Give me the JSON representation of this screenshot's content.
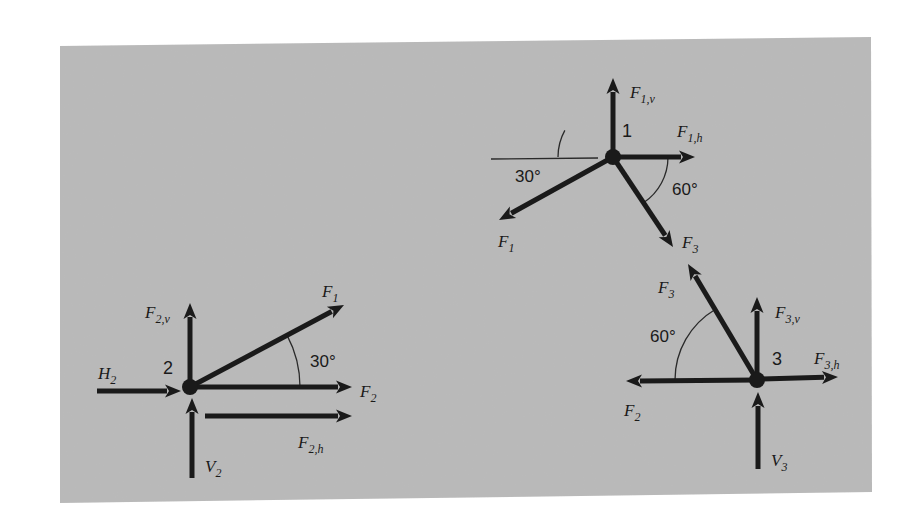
{
  "colors": {
    "page_background": "#ffffff",
    "panel_fill": "#b9b9b9",
    "ink": "#1a1a1a",
    "thin_line": "#2a2a2a"
  },
  "panel": {
    "points": "60,46 871,37 872,492 60,503"
  },
  "nodes": [
    {
      "id": "1",
      "label": "1",
      "center": [
        613,
        157
      ],
      "label_pos": [
        622,
        137
      ],
      "forces": [
        {
          "name": "F1v",
          "label_main": "F",
          "label_sub": "1,v",
          "from": [
            613,
            157
          ],
          "to": [
            613,
            78
          ],
          "label_pos": [
            630,
            98
          ]
        },
        {
          "name": "F1h",
          "label_main": "F",
          "label_sub": "1,h",
          "from": [
            613,
            157
          ],
          "to": [
            695,
            157
          ],
          "label_pos": [
            677,
            137
          ]
        },
        {
          "name": "F1",
          "label_main": "F",
          "label_sub": "1",
          "from": [
            613,
            157
          ],
          "to": [
            499,
            220
          ],
          "label_pos": [
            498,
            247
          ]
        },
        {
          "name": "F3",
          "label_main": "F",
          "label_sub": "3",
          "from": [
            613,
            157
          ],
          "to": [
            673,
            247
          ],
          "label_pos": [
            682,
            248
          ]
        }
      ],
      "reference_lines": [
        {
          "from": [
            491,
            159
          ],
          "to": [
            598,
            158
          ]
        }
      ],
      "angles": [
        {
          "label": "30°",
          "arc_center": [
            613,
            157
          ],
          "radius": 55,
          "start_deg": 180,
          "end_deg": 208.9,
          "label_pos": [
            515,
            182
          ]
        },
        {
          "label": "60°",
          "arc_center": [
            613,
            157
          ],
          "radius": 55,
          "start_deg": 0,
          "end_deg": 56.3,
          "label_pos": [
            672,
            195
          ]
        }
      ]
    },
    {
      "id": "2",
      "label": "2",
      "center": [
        190,
        387
      ],
      "label_pos": [
        163,
        374
      ],
      "forces": [
        {
          "name": "F2v",
          "label_main": "F",
          "label_sub": "2,v",
          "from": [
            190,
            387
          ],
          "to": [
            190,
            303
          ],
          "label_pos": [
            145,
            318
          ]
        },
        {
          "name": "H2",
          "label_main": "H",
          "label_sub": "2",
          "from": [
            97,
            391
          ],
          "to": [
            181,
            391
          ],
          "label_pos": [
            98,
            379
          ]
        },
        {
          "name": "F1",
          "label_main": "F",
          "label_sub": "1",
          "from": [
            190,
            387
          ],
          "to": [
            344,
            305
          ],
          "label_pos": [
            322,
            297
          ]
        },
        {
          "name": "F2",
          "label_main": "F",
          "label_sub": "2",
          "from": [
            190,
            387
          ],
          "to": [
            352,
            387
          ],
          "label_pos": [
            360,
            397
          ]
        },
        {
          "name": "F2h",
          "label_main": "F",
          "label_sub": "2,h",
          "from": [
            205,
            416
          ],
          "to": [
            352,
            416
          ],
          "label_pos": [
            298,
            448
          ]
        },
        {
          "name": "V2",
          "label_main": "V",
          "label_sub": "2",
          "from": [
            192,
            478
          ],
          "to": [
            192,
            398
          ],
          "label_pos": [
            205,
            472
          ]
        }
      ],
      "reference_lines": [],
      "angles": [
        {
          "label": "30°",
          "arc_center": [
            190,
            387
          ],
          "radius": 110,
          "start_deg": 0,
          "end_deg": -28,
          "label_pos": [
            310,
            367
          ]
        }
      ]
    },
    {
      "id": "3",
      "label": "3",
      "center": [
        757,
        380
      ],
      "label_pos": [
        772,
        365
      ],
      "forces": [
        {
          "name": "F3",
          "label_main": "F",
          "label_sub": "3",
          "from": [
            757,
            380
          ],
          "to": [
            688,
            264
          ],
          "label_pos": [
            658,
            293
          ]
        },
        {
          "name": "F3v",
          "label_main": "F",
          "label_sub": "3,v",
          "from": [
            757,
            380
          ],
          "to": [
            757,
            297
          ],
          "label_pos": [
            775,
            318
          ]
        },
        {
          "name": "F3h",
          "label_main": "F",
          "label_sub": "3,h",
          "from": [
            757,
            379
          ],
          "to": [
            838,
            377
          ],
          "label_pos": [
            814,
            364
          ]
        },
        {
          "name": "F2",
          "label_main": "F",
          "label_sub": "2",
          "from": [
            757,
            380
          ],
          "to": [
            626,
            381
          ],
          "label_pos": [
            624,
            416
          ]
        },
        {
          "name": "V3",
          "label_main": "V",
          "label_sub": "3",
          "from": [
            758,
            469
          ],
          "to": [
            758,
            392
          ],
          "label_pos": [
            771,
            466
          ]
        }
      ],
      "reference_lines": [],
      "angles": [
        {
          "label": "60°",
          "arc_center": [
            757,
            380
          ],
          "radius": 82,
          "start_deg": 180,
          "end_deg": 239.3,
          "label_pos": [
            650,
            342
          ]
        }
      ]
    }
  ]
}
